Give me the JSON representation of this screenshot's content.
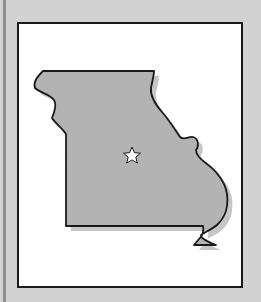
{
  "map": {
    "title": "Missouri state outline",
    "region": "Missouri",
    "marker": "capital-star",
    "colors": {
      "background": "#d2d2d2",
      "frame": "#ffffff",
      "state_fill": "#b3b3b3",
      "shadow": "#c4c4c4",
      "outline": "#1a1a1a",
      "star": "#ffffff"
    }
  }
}
